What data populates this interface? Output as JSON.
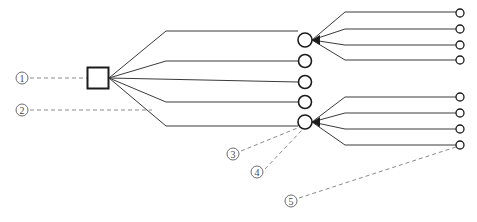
{
  "figure": {
    "background_color": "#ffffff",
    "line_color": "#3a3a3a",
    "leader_color": "#8a8a8a",
    "node_stroke_color": "#1c1c1c",
    "width": 477,
    "height": 222
  },
  "nodes": {
    "root": {
      "shape": "square",
      "x": 98,
      "y": 78,
      "size": 21
    },
    "mid_circles": [
      {
        "label": "mid-node-1",
        "cx": 305,
        "cy": 40,
        "r": 7
      },
      {
        "label": "mid-node-2",
        "cx": 305,
        "cy": 61,
        "r": 6.5
      },
      {
        "label": "mid-node-3",
        "cx": 305,
        "cy": 82,
        "r": 6.5
      },
      {
        "label": "mid-node-4",
        "cx": 305,
        "cy": 102,
        "r": 6.5
      },
      {
        "label": "mid-node-5",
        "cx": 305,
        "cy": 122,
        "r": 7
      }
    ],
    "leaf_circles": [
      {
        "label": "leaf-node-1",
        "cx": 460,
        "cy": 13,
        "r": 4
      },
      {
        "label": "leaf-node-2",
        "cx": 460,
        "cy": 29,
        "r": 4
      },
      {
        "label": "leaf-node-3",
        "cx": 460,
        "cy": 45,
        "r": 4
      },
      {
        "label": "leaf-node-4",
        "cx": 460,
        "cy": 60,
        "r": 4
      },
      {
        "label": "leaf-node-5",
        "cx": 460,
        "cy": 97,
        "r": 4
      },
      {
        "label": "leaf-node-6",
        "cx": 460,
        "cy": 113,
        "r": 4
      },
      {
        "label": "leaf-node-7",
        "cx": 460,
        "cy": 129,
        "r": 4
      },
      {
        "label": "leaf-node-8",
        "cx": 460,
        "cy": 145,
        "r": 4
      }
    ]
  },
  "edges": {
    "root_fan": [
      "M 109 78 L 166 31 L 298 31",
      "M 109 78 L 166 61 L 298 61",
      "M 109 78 L 298 82",
      "M 109 78 L 166 102 L 298 102",
      "M 109 78 L 166 126 L 298 126"
    ],
    "top_fan": [
      "M 312 40 L 345 12 L 456 12",
      "M 312 40 L 345 29 L 456 29",
      "M 312 40 L 345 45 L 456 45",
      "M 312 40 L 345 60 L 456 60"
    ],
    "bottom_fan": [
      "M 312 122 L 345 97 L 456 97",
      "M 312 122 L 345 113 L 456 113",
      "M 312 122 L 345 129 L 456 129",
      "M 312 122 L 345 145 L 456 145"
    ]
  },
  "callouts": [
    {
      "id": "callout-1",
      "number": "①",
      "marker_cx": 22,
      "marker_cy": 78,
      "marker_r": 6,
      "leader": "M 30 78 L 88 78"
    },
    {
      "id": "callout-2",
      "number": "②",
      "marker_cx": 22,
      "marker_cy": 110,
      "marker_r": 6,
      "leader": "M 30 110 L 152 110"
    },
    {
      "id": "callout-3",
      "number": "③",
      "marker_cx": 233,
      "marker_cy": 154,
      "marker_r": 6,
      "leader": "M 241 151 L 300 127"
    },
    {
      "id": "callout-4",
      "number": "④",
      "marker_cx": 257,
      "marker_cy": 172,
      "marker_r": 6,
      "leader": "M 265 169 L 303 129"
    },
    {
      "id": "callout-5",
      "number": "⑤",
      "marker_cx": 291,
      "marker_cy": 201,
      "marker_r": 6,
      "leader": "M 299 198 L 456 147"
    }
  ],
  "arrowheads": [
    {
      "label": "arrow-into-root",
      "points": "109,78 101,73 101,83"
    },
    {
      "label": "arrow-into-mid-1",
      "points": "312,40 320,35 320,45"
    },
    {
      "label": "arrow-into-mid-5",
      "points": "312,122 320,117 320,127"
    }
  ]
}
